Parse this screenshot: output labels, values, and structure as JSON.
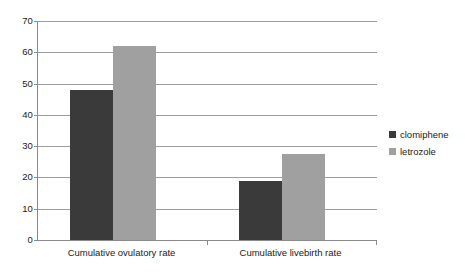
{
  "chart_data": {
    "type": "bar",
    "title": "",
    "subtitle": "",
    "xlabel": "",
    "ylabel": "",
    "ylim": [
      0,
      70
    ],
    "ytick_step": 10,
    "yticks": [
      70,
      60,
      50,
      40,
      30,
      20,
      10,
      0
    ],
    "grid": true,
    "legend_position": "right",
    "categories": [
      "Cumulative ovulatory rate",
      "Cumulative livebirth rate"
    ],
    "series": [
      {
        "name": "clomiphene",
        "color": "#3a3a3a",
        "values": [
          48,
          19
        ]
      },
      {
        "name": "letrozole",
        "color": "#a0a0a0",
        "values": [
          62,
          27.5
        ]
      }
    ]
  },
  "legend": {
    "items": [
      {
        "label": "clomiphene",
        "swatch": "clomiphene"
      },
      {
        "label": "letrozole",
        "swatch": "letrozole"
      }
    ]
  }
}
